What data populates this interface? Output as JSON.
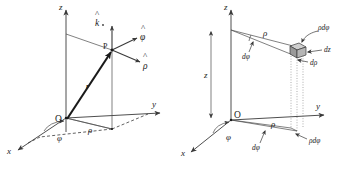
{
  "figure": {
    "background_color": "#ffffff",
    "line_color": "#3a3a3a",
    "text_color": "#1c1c1c",
    "width": 358,
    "height": 169
  },
  "left_panel": {
    "name": "cylindrical-coordinates-unit-vectors",
    "axes": {
      "z_label": "z",
      "y_label": "y",
      "x_label": "x"
    },
    "origin_label": "O",
    "point_label": "P",
    "position_vector_label": "r",
    "radial_distance_label": "ρ",
    "azimuth_angle_label": "φ",
    "unit_vectors": [
      {
        "name": "k-hat",
        "base": "k",
        "hat": "^",
        "label": "k̂"
      },
      {
        "name": "phi-hat",
        "base": "φ",
        "hat": "^",
        "label": "φ̂"
      },
      {
        "name": "rho-hat",
        "base": "ρ",
        "hat": "^",
        "label": "ρ̂"
      }
    ]
  },
  "right_panel": {
    "name": "cylindrical-volume-element",
    "axes": {
      "z_label": "z",
      "y_label": "y",
      "x_label": "x"
    },
    "origin_label": "O",
    "height_label": "z",
    "radial_distance_label": "ρ",
    "azimuth_angle_label": "φ",
    "differentials": {
      "d_rho": "dρ",
      "d_phi_upper": "dφ",
      "d_phi_lower": "dφ",
      "rho_d_phi_upper": "ρdφ",
      "rho_d_phi_lower": "ρdφ",
      "dz": "dz"
    },
    "radial_label_upper": "ρ",
    "radial_label_lower": "ρ"
  }
}
